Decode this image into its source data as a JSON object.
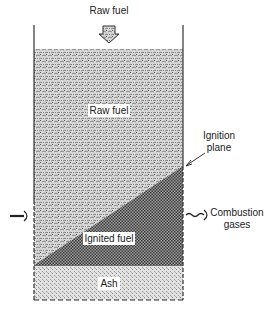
{
  "diagram": {
    "type": "fuel-bed-cross-section",
    "labels": {
      "top_feed": "Raw fuel",
      "raw_fuel_zone": "Raw fuel",
      "ignition_plane_line1": "Ignition",
      "ignition_plane_line2": "plane",
      "ignited_fuel_zone": "Ignited fuel",
      "ash_zone": "Ash",
      "exhaust_line1": "Combustion",
      "exhaust_line2": "gases"
    },
    "zones": [
      {
        "name": "Raw fuel",
        "pattern": "coarse stipple"
      },
      {
        "name": "Ignited fuel",
        "pattern": "crosshatch"
      },
      {
        "name": "Ash",
        "pattern": "fine stipple"
      }
    ],
    "arrows": [
      {
        "name": "raw-fuel-feed",
        "direction": "down"
      },
      {
        "name": "air-inlet",
        "direction": "right"
      },
      {
        "name": "combustion-gas-outlet",
        "direction": "right",
        "style": "wavy"
      },
      {
        "name": "ignition-plane-pointer",
        "direction": "down-left"
      }
    ]
  }
}
